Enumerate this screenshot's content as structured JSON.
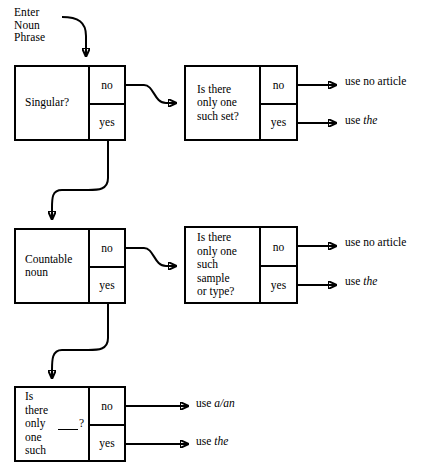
{
  "diagram": {
    "entry_label": "Enter\nNoun\nPhrase",
    "branch_no": "no",
    "branch_yes": "yes",
    "colors": {
      "stroke": "#000000",
      "background": "#ffffff",
      "text": "#000000"
    },
    "nodes": [
      {
        "id": "singular",
        "question": "Singular?",
        "no": "no",
        "yes": "yes"
      },
      {
        "id": "one-such-set",
        "question": "Is there\nonly one\nsuch set?",
        "no": "no",
        "yes": "yes"
      },
      {
        "id": "countable-noun",
        "question": "Countable\nnoun",
        "no": "no",
        "yes": "yes"
      },
      {
        "id": "one-such-sample",
        "question": "Is there\nonly one\nsuch\nsample\nor type?",
        "no": "no",
        "yes": "yes"
      },
      {
        "id": "one-such-blank",
        "question_pre": "Is there\nonly\none\nsuch ",
        "question_post": "?",
        "no": "no",
        "yes": "yes"
      }
    ],
    "outcomes": [
      {
        "id": "set-no",
        "prefix": "use ",
        "emphasis": "",
        "suffix": "no article",
        "from": "one-such-set / no"
      },
      {
        "id": "set-yes",
        "prefix": "use ",
        "emphasis": "the",
        "suffix": "",
        "from": "one-such-set / yes"
      },
      {
        "id": "sample-no",
        "prefix": "use ",
        "emphasis": "",
        "suffix": "no article",
        "from": "one-such-sample / no"
      },
      {
        "id": "sample-yes",
        "prefix": "use ",
        "emphasis": "the",
        "suffix": "",
        "from": "one-such-sample / yes"
      },
      {
        "id": "blank-no",
        "prefix": "use ",
        "emphasis": "a/an",
        "suffix": "",
        "from": "one-such-blank / no"
      },
      {
        "id": "blank-yes",
        "prefix": "use ",
        "emphasis": "the",
        "suffix": "",
        "from": "one-such-blank / yes"
      }
    ]
  }
}
